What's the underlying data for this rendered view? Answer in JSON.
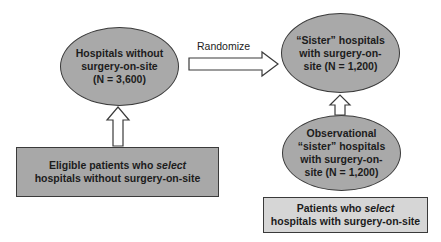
{
  "diagram": {
    "nodes": {
      "hospitals_without": {
        "line1": "Hospitals without",
        "line2": "surgery-on-site",
        "line3": "(N = 3,600)"
      },
      "sister_hospitals": {
        "line1": "“Sister” hospitals",
        "line2": "with surgery-on-",
        "line3": "site (N = 1,200)"
      },
      "observational_sister": {
        "line1": "Observational",
        "line2": "“sister” hospitals",
        "line3": "with surgery-on-",
        "line4": "site (N = 1,200)"
      },
      "eligible_patients_box": {
        "line1_pre": "Eligible patients who ",
        "line1_em": "select",
        "line2": "hospitals without surgery-on-site"
      },
      "patients_select_box": {
        "line1_pre": "Patients who ",
        "line1_em": "select",
        "line2": "hospitals with surgery-on-site"
      }
    },
    "edges": {
      "randomize_label": "Randomize"
    },
    "colors": {
      "ellipse_fill": "#a9a9a9",
      "left_box_fill": "#a8a8a8",
      "right_box_fill": "#d6d6d6",
      "stroke": "#3a3a3a",
      "arrow_fill": "#ffffff"
    }
  }
}
